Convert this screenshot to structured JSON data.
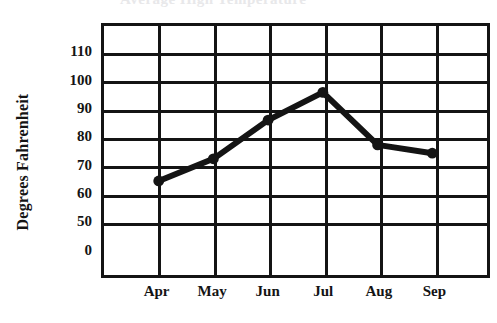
{
  "chart_data": {
    "type": "line",
    "title": "",
    "xlabel": "",
    "ylabel": "Degrees Fahrenheit",
    "categories": [
      "Apr",
      "May",
      "Jun",
      "Jul",
      "Aug",
      "Sep"
    ],
    "values": [
      64,
      72,
      86,
      96,
      77,
      74
    ],
    "series": [
      {
        "name": "Degrees Fahrenheit",
        "values": [
          64,
          72,
          86,
          96,
          77,
          74
        ]
      }
    ],
    "ytick_labels": [
      "110",
      "100",
      "90",
      "80",
      "70",
      "60",
      "50",
      "0"
    ],
    "ytick_values": [
      110,
      100,
      90,
      80,
      70,
      60,
      50,
      0
    ],
    "axis_break": true,
    "axis_break_note": "y-axis jumps from 0 to 50",
    "ylim": [
      0,
      115
    ],
    "grid": true,
    "legend": false,
    "line_color": "#141414",
    "marker": "circle",
    "marker_color": "#141414"
  },
  "clipped_title": {
    "text": "Average High Temperature"
  }
}
